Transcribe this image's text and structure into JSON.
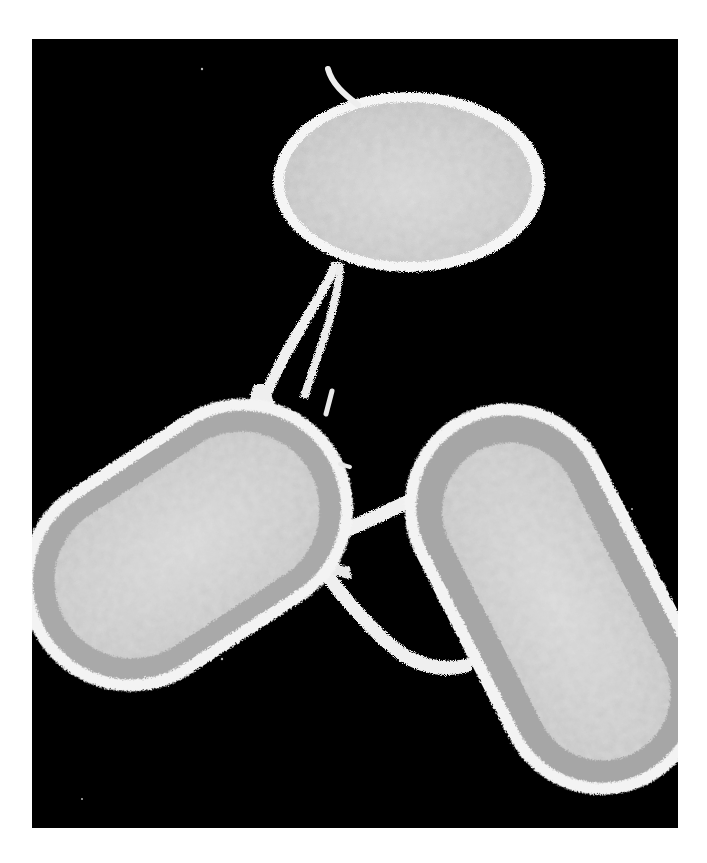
{
  "figure": {
    "kind": "electron micrograph",
    "background_color": "#000000",
    "page_color": "#ffffff",
    "cell_edge_color": "#f2f2f2",
    "cell_fill_color": "#c9c9c9",
    "cell_ring_color": "#a8a8a8",
    "cells": [
      {
        "name": "top-cell",
        "shape": "oval",
        "center": [
          377,
          143
        ],
        "rx": 133,
        "ry": 88,
        "rotation": 0,
        "ring": false
      },
      {
        "name": "left-cell",
        "shape": "rod",
        "center": [
          155,
          506
        ],
        "rx": 175,
        "ry": 108,
        "rotation": -33,
        "ring": true
      },
      {
        "name": "right-cell",
        "shape": "rod",
        "center": [
          523,
          560
        ],
        "rx": 205,
        "ry": 102,
        "rotation": 63,
        "ring": true
      }
    ],
    "connections": [
      "top-cell to left-cell (two parallel nanotubes)",
      "left-cell to right-cell (upper bridge)",
      "left-cell to right-cell (lower bridge)"
    ],
    "scale_bar": null,
    "labels": []
  }
}
